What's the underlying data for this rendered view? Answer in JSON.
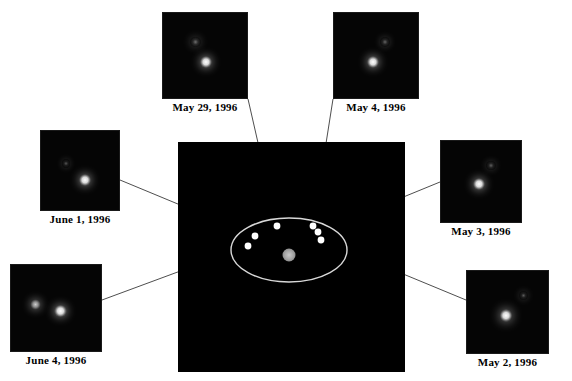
{
  "figure": {
    "background_color": "#ffffff",
    "field_color": "#000000",
    "connector_color": "#3a3a3a",
    "orbit_color": "#d8d8d8",
    "marker_color": "#ffffff",
    "primary_body_color": "#a8a8a8",
    "width": 572,
    "height": 381
  },
  "central_field": {
    "name": "orbit-diagram",
    "x": 178,
    "y": 142,
    "width": 227,
    "height": 230,
    "orbit": {
      "center_x": 289,
      "center_y": 250,
      "radius_x": 58,
      "radius_y": 32,
      "stroke_width": 1.4
    },
    "primary_body": {
      "label": "central-body",
      "cx": 289,
      "cy": 255,
      "r": 6.5,
      "color": "#a8a8a8"
    },
    "markers": [
      {
        "label": "marker-june-4",
        "cx": 248,
        "cy": 246,
        "r": 3.4
      },
      {
        "label": "marker-june-1",
        "cx": 255,
        "cy": 236,
        "r": 3.4
      },
      {
        "label": "marker-may-29",
        "cx": 277,
        "cy": 226,
        "r": 3.4
      },
      {
        "label": "marker-may-4",
        "cx": 313,
        "cy": 226,
        "r": 3.4
      },
      {
        "label": "marker-may-3",
        "cx": 318,
        "cy": 232,
        "r": 3.4
      },
      {
        "label": "marker-may-2",
        "cx": 321,
        "cy": 240,
        "r": 3.4
      }
    ]
  },
  "panels": [
    {
      "id": "may-29-1996",
      "caption": "May 29, 1996",
      "x": 162,
      "y": 12,
      "w": 86,
      "h": 87,
      "caption_y": 101,
      "stars": [
        {
          "name": "companion",
          "cx": 0.38,
          "cy": 0.33,
          "r": 5.2,
          "brightness": 0.42
        },
        {
          "name": "primary",
          "cx": 0.5,
          "cy": 0.56,
          "r": 6.0,
          "brightness": 1.0
        }
      ],
      "connector": {
        "from_x": 248,
        "from_y": 99,
        "to_marker": "marker-may-29"
      }
    },
    {
      "id": "may-4-1996",
      "caption": "May 4, 1996",
      "x": 333,
      "y": 12,
      "w": 86,
      "h": 87,
      "caption_y": 101,
      "stars": [
        {
          "name": "companion",
          "cx": 0.59,
          "cy": 0.33,
          "r": 4.8,
          "brightness": 0.38
        },
        {
          "name": "primary",
          "cx": 0.45,
          "cy": 0.56,
          "r": 6.0,
          "brightness": 1.0
        }
      ],
      "connector": {
        "from_x": 333,
        "from_y": 99,
        "to_marker": "marker-may-4"
      }
    },
    {
      "id": "june-1-1996",
      "caption": "June 1, 1996",
      "x": 40,
      "y": 130,
      "w": 80,
      "h": 81,
      "caption_y": 213,
      "stars": [
        {
          "name": "companion",
          "cx": 0.31,
          "cy": 0.4,
          "r": 4.2,
          "brightness": 0.32
        },
        {
          "name": "primary",
          "cx": 0.55,
          "cy": 0.6,
          "r": 6.0,
          "brightness": 1.0
        }
      ],
      "connector": {
        "from_x": 120,
        "from_y": 180,
        "to_marker": "marker-june-1"
      }
    },
    {
      "id": "may-3-1996",
      "caption": "May 3, 1996",
      "x": 440,
      "y": 140,
      "w": 82,
      "h": 83,
      "caption_y": 225,
      "stars": [
        {
          "name": "companion",
          "cx": 0.61,
          "cy": 0.3,
          "r": 4.6,
          "brightness": 0.36
        },
        {
          "name": "primary",
          "cx": 0.46,
          "cy": 0.52,
          "r": 6.2,
          "brightness": 1.0
        }
      ],
      "connector": {
        "from_x": 440,
        "from_y": 182,
        "to_marker": "marker-may-3"
      }
    },
    {
      "id": "june-4-1996",
      "caption": "June 4, 1996",
      "x": 10,
      "y": 264,
      "w": 92,
      "h": 88,
      "caption_y": 354,
      "stars": [
        {
          "name": "companion",
          "cx": 0.27,
          "cy": 0.45,
          "r": 5.4,
          "brightness": 0.8
        },
        {
          "name": "primary",
          "cx": 0.54,
          "cy": 0.52,
          "r": 6.2,
          "brightness": 1.0
        }
      ],
      "connector": {
        "from_x": 102,
        "from_y": 300,
        "to_marker": "marker-june-4"
      }
    },
    {
      "id": "may-2-1996",
      "caption": "May 2, 1996",
      "x": 466,
      "y": 270,
      "w": 83,
      "h": 84,
      "caption_y": 356,
      "stars": [
        {
          "name": "companion",
          "cx": 0.68,
          "cy": 0.29,
          "r": 4.4,
          "brightness": 0.34
        },
        {
          "name": "primary",
          "cx": 0.47,
          "cy": 0.53,
          "r": 6.4,
          "brightness": 1.0
        }
      ],
      "connector": {
        "from_x": 466,
        "from_y": 300,
        "to_marker": "marker-may-2"
      }
    }
  ]
}
